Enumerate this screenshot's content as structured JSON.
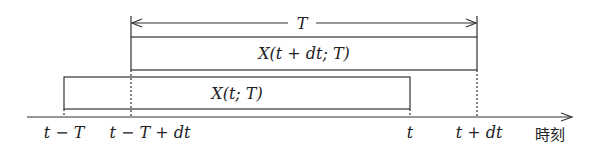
{
  "diagram": {
    "type": "timeline-window",
    "span_label": "T",
    "windows": [
      {
        "id": "shifted",
        "label": "X(t + dt; T)",
        "start_tick": "t − T + dt",
        "end_tick": "t + dt"
      },
      {
        "id": "current",
        "label": "X(t; T)",
        "start_tick": "t − T",
        "end_tick": "t"
      }
    ],
    "axis": {
      "label": "時刻",
      "ticks": [
        "t − T",
        "t − T + dt",
        "t",
        "t + dt"
      ]
    }
  }
}
